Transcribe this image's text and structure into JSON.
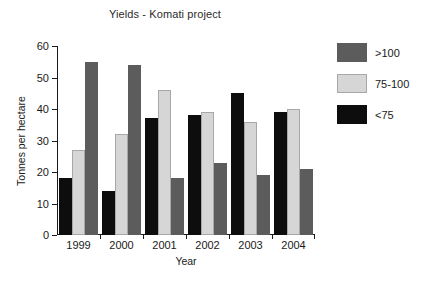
{
  "chart_data": {
    "type": "bar",
    "title": "Yields - Komati project",
    "xlabel": "Year",
    "ylabel": "Tonnes per hectare",
    "categories": [
      "1999",
      "2000",
      "2001",
      "2002",
      "2003",
      "2004"
    ],
    "series": [
      {
        "name": "<75",
        "color": "#0d0d0d",
        "values": [
          18,
          14,
          37,
          38,
          45,
          39
        ]
      },
      {
        "name": "75-100",
        "color": "#d6d6d6",
        "values": [
          27,
          32,
          46,
          39,
          36,
          40
        ]
      },
      {
        "name": ">100",
        "color": "#5c5c5c",
        "values": [
          55,
          54,
          18,
          23,
          19,
          21
        ]
      }
    ],
    "legend_order": [
      ">100",
      "75-100",
      "<75"
    ],
    "legend_position": "right",
    "ylim": [
      0,
      60
    ],
    "yticks": [
      0,
      10,
      20,
      30,
      40,
      50,
      60
    ],
    "ytick_labels": [
      "0",
      "10",
      "20",
      "30",
      "40",
      "50",
      "60"
    ],
    "grid": false
  }
}
